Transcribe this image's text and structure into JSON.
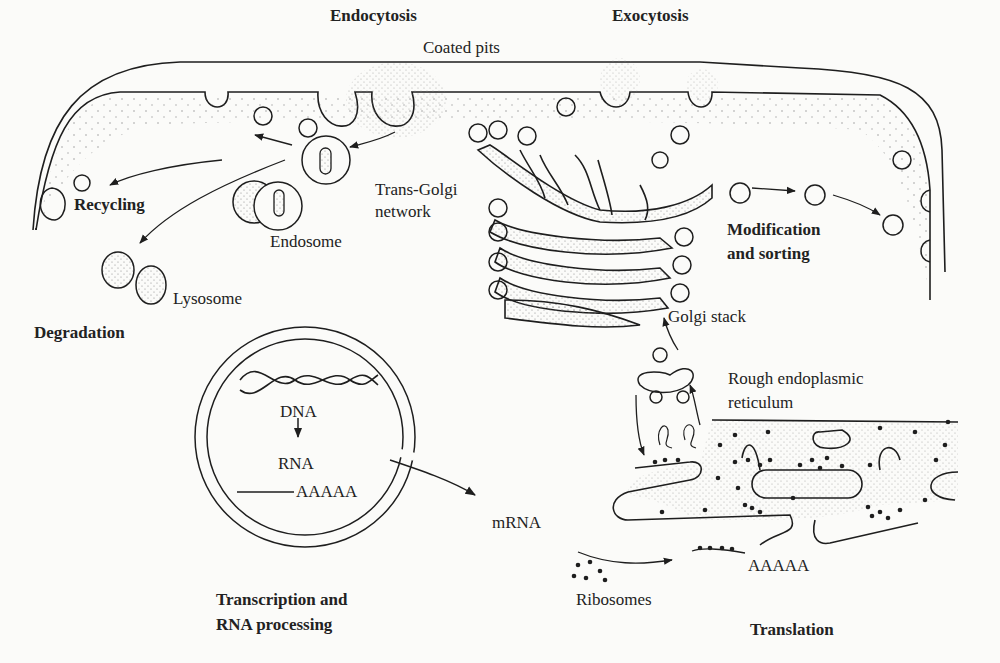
{
  "labels": {
    "endocytosis": "Endocytosis",
    "exocytosis": "Exocytosis",
    "coated_pits": "Coated pits",
    "recycling": "Recycling",
    "trans_golgi_1": "Trans-Golgi",
    "trans_golgi_2": "network",
    "endosome": "Endosome",
    "lysosome": "Lysosome",
    "degradation": "Degradation",
    "modification_1": "Modification",
    "modification_2": "and sorting",
    "golgi_stack": "Golgi stack",
    "rough_er_1": "Rough endoplasmic",
    "rough_er_2": "reticulum",
    "dna": "DNA",
    "rna": "RNA",
    "polya_nucleus": "AAAAA",
    "mrna": "mRNA",
    "polya_cytoplasm": "AAAAA",
    "ribosomes": "Ribosomes",
    "transcription_1": "Transcription and",
    "transcription_2": "RNA processing",
    "translation": "Translation"
  },
  "colors": {
    "ink": "#1e1e1e",
    "paper": "#fbfbf9",
    "stipple": "#9a9a9a"
  }
}
